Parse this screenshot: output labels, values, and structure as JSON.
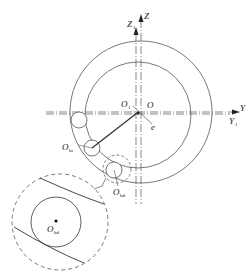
{
  "diagram": {
    "type": "bearing-geometry",
    "colors": {
      "line": "#555555",
      "text": "#222222",
      "background": "#ffffff"
    },
    "axes": {
      "z": {
        "label": "Z"
      },
      "z1": {
        "label": "Z",
        "sub": "1"
      },
      "y": {
        "label": "Y"
      },
      "y1": {
        "label": "Y",
        "sub": "1"
      }
    },
    "points": {
      "o": {
        "label": "O"
      },
      "o1": {
        "label": "O",
        "sub": "1"
      },
      "e": {
        "label": "e"
      },
      "obi": {
        "label": "O",
        "sub": "bi"
      },
      "obd": {
        "label": "O",
        "sub": "bd"
      },
      "obd_zoom": {
        "label": "O",
        "sub": "bd"
      }
    }
  }
}
